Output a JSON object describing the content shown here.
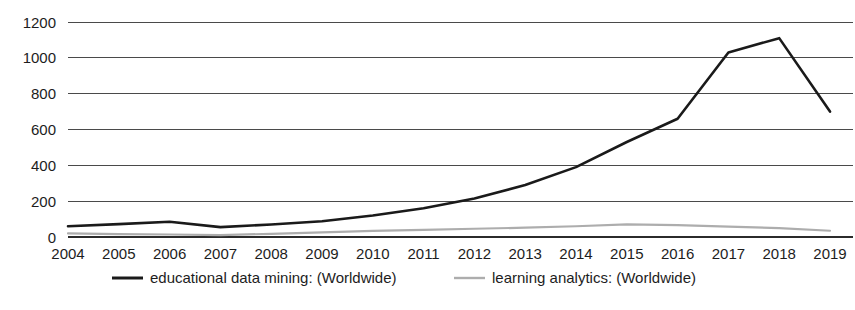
{
  "chart_data": {
    "type": "line",
    "title": "",
    "subtitle": "",
    "xlabel": "",
    "ylabel": "",
    "grid": true,
    "legend_position": "bottom",
    "xlim": [
      2004,
      2019
    ],
    "ylim": [
      0,
      1200
    ],
    "yticks": [
      0,
      200,
      400,
      600,
      800,
      1000,
      1200
    ],
    "ytick_labels": [
      "0",
      "200",
      "400",
      "600",
      "800",
      "1000",
      "1200"
    ],
    "categories": [
      2004,
      2005,
      2006,
      2007,
      2008,
      2009,
      2010,
      2011,
      2012,
      2013,
      2014,
      2015,
      2016,
      2017,
      2018,
      2019
    ],
    "xtick_labels": [
      "2004",
      "2005",
      "2006",
      "2007",
      "2008",
      "2009",
      "2010",
      "2011",
      "2012",
      "2013",
      "2014",
      "2015",
      "2016",
      "2017",
      "2018",
      "2019"
    ],
    "series": [
      {
        "name": "educational data mining: (Worldwide)",
        "color": "#1a1a1a",
        "width": 2.6,
        "values": [
          60,
          72,
          85,
          55,
          70,
          88,
          120,
          160,
          215,
          290,
          390,
          530,
          660,
          1030,
          1110,
          700
        ]
      },
      {
        "name": "learning analytics: (Worldwide)",
        "color": "#adadad",
        "width": 2.2,
        "values": [
          20,
          16,
          14,
          10,
          18,
          26,
          34,
          40,
          46,
          52,
          60,
          70,
          66,
          58,
          50,
          35
        ]
      }
    ]
  },
  "legend": {
    "items": [
      {
        "label": "educational data mining: (Worldwide)",
        "color": "#1a1a1a"
      },
      {
        "label": "learning analytics: (Worldwide)",
        "color": "#adadad"
      }
    ]
  }
}
